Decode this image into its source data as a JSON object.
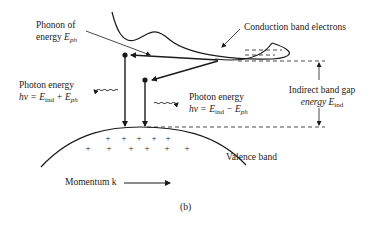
{
  "figure": {
    "caption": "(b)",
    "labels": {
      "phonon_line1": "Phonon of",
      "phonon_line2_text": "energy ",
      "phonon_symbol": "E",
      "phonon_sub": "ph",
      "conduction": "Conduction band electrons",
      "photon_left_line1": "Photon energy",
      "photon_left_line2_prefix": "hν = E",
      "photon_left_sub1": "ind",
      "photon_left_mid": " + E",
      "photon_left_sub2": "ph",
      "photon_right_line1": "Photon energy",
      "photon_right_line2_prefix": "hν = E",
      "photon_right_sub1": "ind",
      "photon_right_mid": " − E",
      "photon_right_sub2": "ph",
      "gap_line1": "Indirect band gap",
      "gap_line2_text": "energy E",
      "gap_sub": "ind",
      "valence": "Valence band",
      "momentum": "Momentum k"
    },
    "colors": {
      "ink": "#1a1a1a",
      "background": "#ffffff"
    }
  }
}
